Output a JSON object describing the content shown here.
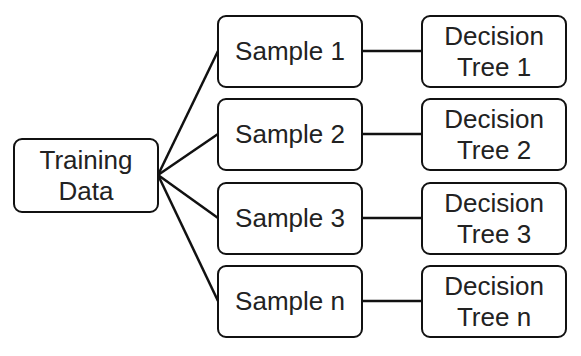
{
  "diagram": {
    "root": {
      "line1": "Training",
      "line2": "Data"
    },
    "samples": [
      {
        "label": "Sample 1"
      },
      {
        "label": "Sample 2"
      },
      {
        "label": "Sample 3"
      },
      {
        "label": "Sample n"
      }
    ],
    "trees": [
      {
        "line1": "Decision",
        "line2": "Tree 1"
      },
      {
        "line1": "Decision",
        "line2": "Tree 2"
      },
      {
        "line1": "Decision",
        "line2": "Tree 3"
      },
      {
        "line1": "Decision",
        "line2": "Tree n"
      }
    ],
    "colors": {
      "stroke": "#111111",
      "text": "#222222",
      "background": "#ffffff"
    }
  }
}
